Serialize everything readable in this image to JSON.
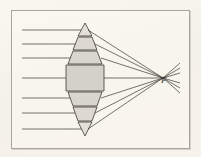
{
  "figure": {
    "description": "Seven parallel horizontal rays enter from the left, pass through a biconvex lens drawn as seven stacked prism/slab sections, and converge to the focal point F on the right before diverging again.",
    "background_color": "#f7f4ec",
    "frame_color": "#a9a49c",
    "ink_color": "#3b3833",
    "glass_fill": "#d9d6cf",
    "focal_label": "F"
  },
  "diagram_data": {
    "type": "optics-ray-diagram",
    "optical_axis_y": 78,
    "lens": {
      "center_x": 85,
      "top_y": 23,
      "bottom_y": 136,
      "sections": [
        {
          "name": "prism-top-apex",
          "shape": "triangle",
          "y_top": 23,
          "y_bottom": 36,
          "half_width_top": 0,
          "half_width_bottom": 7,
          "fill": "#e3e0d8"
        },
        {
          "name": "prism-upper-2",
          "shape": "trapezoid",
          "y_top": 37,
          "y_bottom": 50,
          "half_width_top": 7,
          "half_width_bottom": 12,
          "fill": "#ddd9d1"
        },
        {
          "name": "prism-upper-3",
          "shape": "trapezoid",
          "y_top": 51,
          "y_bottom": 64,
          "half_width_top": 12,
          "half_width_bottom": 17,
          "fill": "#d9d6cf"
        },
        {
          "name": "slab-center",
          "shape": "rectangle",
          "y_top": 65,
          "y_bottom": 91,
          "half_width_top": 19,
          "half_width_bottom": 19,
          "fill": "#d4d1c8"
        },
        {
          "name": "prism-lower-5",
          "shape": "trapezoid",
          "y_top": 92,
          "y_bottom": 106,
          "half_width_top": 17,
          "half_width_bottom": 12,
          "fill": "#d9d6cf"
        },
        {
          "name": "prism-lower-6",
          "shape": "trapezoid",
          "y_top": 107,
          "y_bottom": 121,
          "half_width_top": 12,
          "half_width_bottom": 7,
          "fill": "#ddd9d1"
        },
        {
          "name": "prism-bottom-apex",
          "shape": "triangle",
          "y_top": 122,
          "y_bottom": 136,
          "half_width_top": 7,
          "half_width_bottom": 0,
          "fill": "#e3e0d8"
        }
      ]
    },
    "focal_point": {
      "x": 163,
      "y": 78,
      "label": "F"
    },
    "incoming_rays": {
      "count": 7,
      "x_start": 22,
      "y_values": [
        30,
        44,
        58,
        78,
        98,
        113,
        129
      ]
    },
    "refracted_rays": {
      "count": 7,
      "note": "each ray leaves the lens right surface and converges to F",
      "exit_points": [
        {
          "x": 88,
          "y": 30
        },
        {
          "x": 95,
          "y": 44
        },
        {
          "x": 101,
          "y": 58
        },
        {
          "x": 104,
          "y": 78
        },
        {
          "x": 101,
          "y": 98
        },
        {
          "x": 95,
          "y": 113
        },
        {
          "x": 88,
          "y": 129
        }
      ]
    },
    "diverging_rays": {
      "count": 6,
      "x_end": 180,
      "y_end_values": [
        63,
        68,
        73,
        83,
        88,
        93
      ]
    }
  }
}
